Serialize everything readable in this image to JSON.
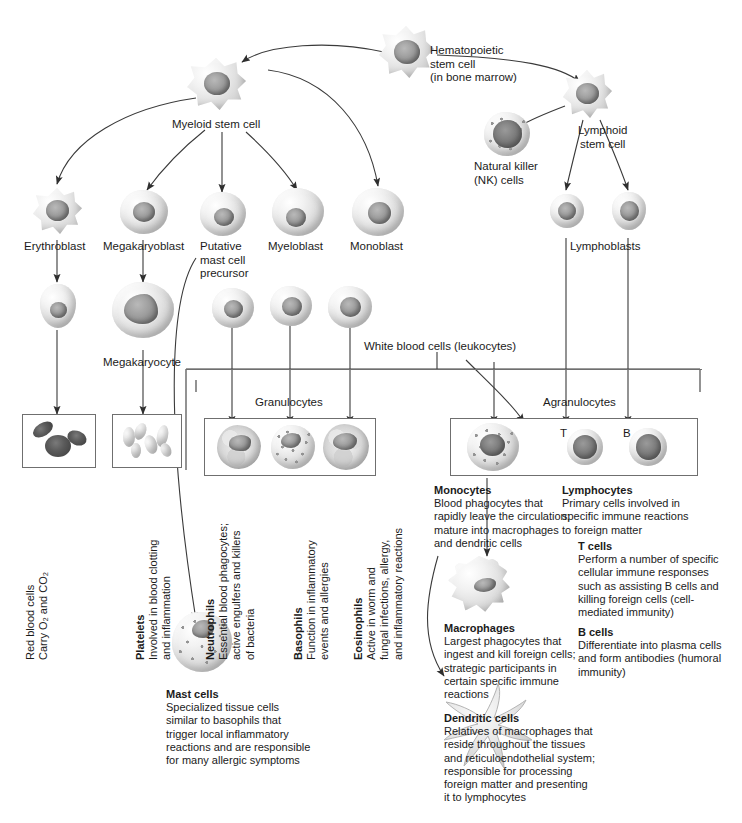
{
  "diagram": {
    "accent": "#1b1b1b",
    "line_color": "#3a3a3a",
    "box_border": "#6f6f6f"
  },
  "nodes": {
    "hematopoietic_stem_cell": "Hematopoietic\nstem cell\n(in bone marrow)",
    "myeloid_stem_cell": "Myeloid stem cell",
    "lymphoid_stem_cell": "Lymphoid\nstem cell",
    "natural_killer": "Natural killer\n(NK) cells",
    "erythroblast": "Erythroblast",
    "megakaryoblast": "Megakaryoblast",
    "putative_mast": "Putative\nmast cell\nprecursor",
    "myeloblast": "Myeloblast",
    "monoblast": "Monoblast",
    "megakaryocyte": "Megakaryocyte",
    "lymphoblasts": "Lymphoblasts",
    "white_blood_cells": "White blood cells (leukocytes)",
    "granulocytes": "Granulocytes",
    "agranulocytes": "Agranulocytes",
    "t_cell_tag": "T",
    "b_cell_tag": "B"
  },
  "vertical_notes": [
    {
      "key": "red-blood-cells",
      "title": "",
      "lines": [
        "Red blood cells",
        "Carry O₂ and CO₂"
      ]
    },
    {
      "key": "platelets",
      "title": "Platelets",
      "lines": [
        "Involved in blood clotting",
        "and inflammation"
      ]
    },
    {
      "key": "neutrophils",
      "title": "Neutrophils",
      "lines": [
        "Essential blood phagocytes;",
        "active engulfers and killers",
        "of bacteria"
      ]
    },
    {
      "key": "basophils",
      "title": "Basophils",
      "lines": [
        "Function in inflammatory",
        "events and allergies"
      ]
    },
    {
      "key": "eosinophils",
      "title": "Eosinophils",
      "lines": [
        "Active in worm and",
        "fungal infections, allergy,",
        "and inflammatory reactions"
      ]
    }
  ],
  "notes": {
    "monocytes": {
      "title": "Monocytes",
      "lines": [
        "Blood phagocytes that",
        "rapidly leave the circulation;",
        "mature into macrophages",
        "and dendritic cells"
      ]
    },
    "lymphocytes": {
      "title": "Lymphocytes",
      "lines": [
        "Primary cells involved in",
        "specific immune reactions",
        "to foreign matter"
      ]
    },
    "t_cells": {
      "title": "T cells",
      "lines": [
        "Perform a number of specific",
        "cellular immune responses",
        "such as assisting B cells and",
        "killing foreign cells (cell-",
        "mediated immunity)"
      ]
    },
    "b_cells": {
      "title": "B cells",
      "lines": [
        "Differentiate into plasma cells",
        "and form antibodies (humoral",
        "immunity)"
      ]
    },
    "macrophages": {
      "title": "Macrophages",
      "lines": [
        "Largest phagocytes that",
        "ingest and kill foreign cells;",
        "strategic participants in",
        "certain specific immune",
        "reactions"
      ]
    },
    "dendritic_cells": {
      "title": "Dendritic cells",
      "lines": [
        "Relatives of macrophages that",
        "reside throughout the tissues",
        "and reticuloendothelial system;",
        "responsible for processing",
        "foreign matter and presenting",
        "it to lymphocytes"
      ]
    },
    "mast_cells": {
      "title": "Mast cells",
      "lines": [
        "Specialized tissue cells",
        "similar to basophils that",
        "trigger local inflammatory",
        "reactions and are responsible",
        "for many allergic symptoms"
      ]
    }
  }
}
